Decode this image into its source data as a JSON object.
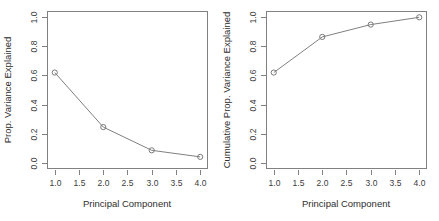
{
  "figure": {
    "background": "#ffffff",
    "line_color": "#808080",
    "point_color": "#7a7a7a",
    "text_color": "#3b3b3b"
  },
  "chart_data": [
    {
      "type": "line",
      "panel": "left",
      "title": "",
      "xlabel": "Principal Component",
      "ylabel": "Prop. Variance Explained",
      "x": [
        1,
        2,
        3,
        4
      ],
      "values": [
        0.62,
        0.245,
        0.085,
        0.04
      ],
      "series": [
        {
          "name": "Prop. Variance Explained",
          "values": [
            0.62,
            0.245,
            0.085,
            0.04
          ]
        }
      ],
      "xlim": [
        0.85,
        4.15
      ],
      "ylim": [
        -0.04,
        1.04
      ],
      "xticks": [
        1.0,
        1.5,
        2.0,
        2.5,
        3.0,
        3.5,
        4.0
      ],
      "xticklabels": [
        "1.0",
        "1.5",
        "2.0",
        "2.5",
        "3.0",
        "3.5",
        "4.0"
      ],
      "yticks": [
        0.0,
        0.2,
        0.4,
        0.6,
        0.8,
        1.0
      ],
      "yticklabels": [
        "0.0",
        "0.2",
        "0.4",
        "0.6",
        "0.8",
        "1.0"
      ],
      "grid": false,
      "legend": "none",
      "marker": "open-circle"
    },
    {
      "type": "line",
      "panel": "right",
      "title": "",
      "xlabel": "Principal Component",
      "ylabel": "Cumulative Prop. Variance Explained",
      "x": [
        1,
        2,
        3,
        4
      ],
      "values": [
        0.62,
        0.865,
        0.95,
        1.0
      ],
      "series": [
        {
          "name": "Cumulative Prop. Variance Explained",
          "values": [
            0.62,
            0.865,
            0.95,
            1.0
          ]
        }
      ],
      "xlim": [
        0.85,
        4.15
      ],
      "ylim": [
        -0.04,
        1.04
      ],
      "xticks": [
        1.0,
        1.5,
        2.0,
        2.5,
        3.0,
        3.5,
        4.0
      ],
      "xticklabels": [
        "1.0",
        "1.5",
        "2.0",
        "2.5",
        "3.0",
        "3.5",
        "4.0"
      ],
      "yticks": [
        0.0,
        0.2,
        0.4,
        0.6,
        0.8,
        1.0
      ],
      "yticklabels": [
        "0.0",
        "0.2",
        "0.4",
        "0.6",
        "0.8",
        "1.0"
      ],
      "grid": false,
      "legend": "none",
      "marker": "open-circle"
    }
  ]
}
